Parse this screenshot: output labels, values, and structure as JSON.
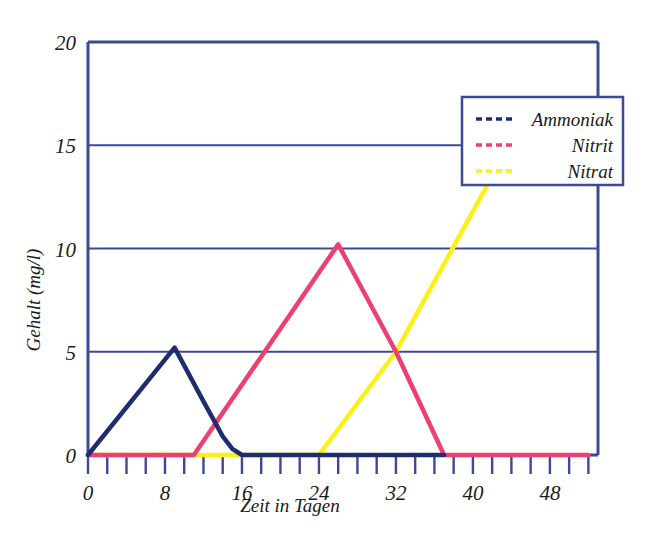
{
  "chart_data": {
    "type": "line",
    "title": "",
    "xlabel": "Zeit in Tagen",
    "ylabel": "Gehalt (mg/l)",
    "xlim": [
      0,
      53
    ],
    "ylim": [
      0,
      20
    ],
    "xticks": [
      0,
      2,
      4,
      6,
      8,
      10,
      12,
      14,
      16,
      18,
      20,
      22,
      24,
      26,
      28,
      30,
      32,
      34,
      36,
      38,
      40,
      42,
      44,
      46,
      48,
      50,
      52
    ],
    "xtick_labels": [
      "0",
      "8",
      "16",
      "24",
      "32",
      "40",
      "48"
    ],
    "xtick_label_values": [
      0,
      8,
      16,
      24,
      32,
      40,
      48
    ],
    "yticks": [
      0,
      5,
      10,
      15,
      20
    ],
    "ytick_labels": [
      "0",
      "5",
      "10",
      "15",
      "20"
    ],
    "grid": "horizontal",
    "legend_position": "top-right",
    "colors": {
      "ammoniak": "#1f2d6e",
      "nitrit": "#ee4070",
      "nitrat": "#fdf015",
      "axis": "#3b4a96",
      "grid": "#3b4a96",
      "background": "#ffffff"
    },
    "series": [
      {
        "name": "Ammoniak",
        "color": "#1f2d6e",
        "x": [
          0,
          9,
          12,
          14,
          15,
          16,
          37
        ],
        "y": [
          0,
          5.2,
          2.6,
          0.9,
          0.3,
          0,
          0
        ]
      },
      {
        "name": "Nitrit",
        "color": "#ee4070",
        "x": [
          0,
          11,
          26,
          32,
          37,
          52
        ],
        "y": [
          0,
          0,
          10.2,
          5,
          0,
          0
        ]
      },
      {
        "name": "Nitrat",
        "color": "#fdf015",
        "x": [
          0,
          24,
          32,
          42
        ],
        "y": [
          0,
          0,
          5,
          13.5
        ]
      }
    ]
  },
  "legend": {
    "entries": [
      {
        "label": "Ammoniak",
        "color": "#1f2d6e",
        "swatch": "dashed-line-swatch"
      },
      {
        "label": "Nitrit",
        "color": "#ee4070",
        "swatch": "dashed-line-swatch"
      },
      {
        "label": "Nitrat",
        "color": "#fdf015",
        "swatch": "dashed-line-swatch"
      }
    ]
  },
  "axes": {
    "y_title": "Gehalt (mg/l)",
    "x_title": "Zeit in Tagen"
  }
}
